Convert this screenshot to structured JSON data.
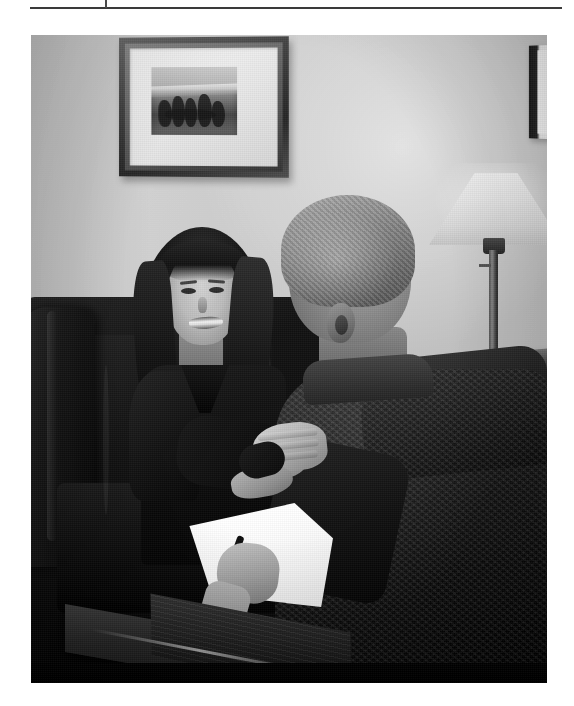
{
  "page": {
    "background_color": "#ffffff",
    "width": 574,
    "height": 706
  },
  "header": {
    "rule_label": "header-separator-rule",
    "rule_color": "#3a3a3a",
    "tick_label": "header-tick-mark"
  },
  "photo": {
    "caption": "",
    "alt": "Black and white photograph of a job interview: a smiling young woman with long dark hair seated on a dark leather sofa shakes hands across a low wooden table with a gray-haired man seen from behind, who holds a pen over a sheet of white paper.",
    "treatment": "grayscale",
    "scene": {
      "setting": "office reception room",
      "wall_color": "#d2d2d2",
      "elements": [
        {
          "name": "framed-artwork",
          "description": "framed landscape picture with wide white mat and dark wood frame on the wall"
        },
        {
          "name": "partial-frame",
          "description": "second picture frame partially cut off at the right edge"
        },
        {
          "name": "table-lamp",
          "description": "table lamp with tapered shade on a side table"
        },
        {
          "name": "side-table",
          "description": "dark wooden side table beneath the lamp"
        },
        {
          "name": "leather-sofa",
          "description": "dark leather sofa where the woman is seated"
        },
        {
          "name": "interviewee",
          "description": "smiling woman in dark jacket with long dark hair"
        },
        {
          "name": "interviewer",
          "description": "gray-haired man in dark textured jacket, back to camera"
        },
        {
          "name": "handshake",
          "description": "the two people shaking hands"
        },
        {
          "name": "paper-sheet",
          "description": "white sheet of paper held by the man"
        },
        {
          "name": "pen",
          "description": "dark pen in the man's hand"
        },
        {
          "name": "wooden-desk",
          "description": "dark wooden low table in the foreground"
        }
      ]
    }
  }
}
